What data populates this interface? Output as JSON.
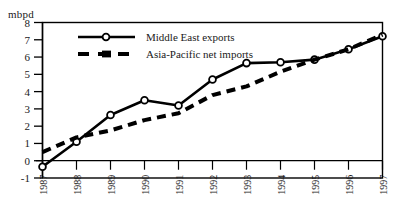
{
  "chart_data": {
    "type": "line",
    "title": "",
    "subtitle": "",
    "xlabel": "",
    "ylabel": "mbpd",
    "unit_label": "mbpd",
    "categories": [
      "1987",
      "1988",
      "1989",
      "1990",
      "1991",
      "1992",
      "1993",
      "1994",
      "1995",
      "1996",
      "1997"
    ],
    "x": [
      1987,
      1988,
      1989,
      1990,
      1991,
      1992,
      1993,
      1994,
      1995,
      1996,
      1997
    ],
    "xlim": [
      1987,
      1997
    ],
    "ylim": [
      -1,
      8
    ],
    "ytick_labels": [
      "8",
      "7",
      "6",
      "5",
      "4",
      "3",
      "2",
      "1",
      "0",
      "-1"
    ],
    "yticks": [
      8,
      7,
      6,
      5,
      4,
      3,
      2,
      1,
      0,
      -1
    ],
    "grid": false,
    "legend_position": "top-center",
    "series": [
      {
        "name": "Middle East exports",
        "style": "solid",
        "marker": "open-circle",
        "color": "#000000",
        "values": [
          -0.35,
          1.1,
          2.65,
          3.5,
          3.2,
          4.7,
          5.65,
          5.7,
          5.85,
          6.45,
          7.2
        ]
      },
      {
        "name": "Asia-Pacific net imports",
        "style": "dashed",
        "marker": "filled-square",
        "color": "#000000",
        "values": [
          0.5,
          1.35,
          1.75,
          2.35,
          2.75,
          3.8,
          4.3,
          5.15,
          5.85,
          6.45,
          7.3
        ]
      }
    ],
    "legend": [
      {
        "label": "Middle East exports",
        "style": "solid",
        "marker": "open-circle"
      },
      {
        "label": "Asia-Pacific net imports",
        "style": "dashed",
        "marker": "filled-square"
      }
    ],
    "axis_color": "#000000"
  }
}
